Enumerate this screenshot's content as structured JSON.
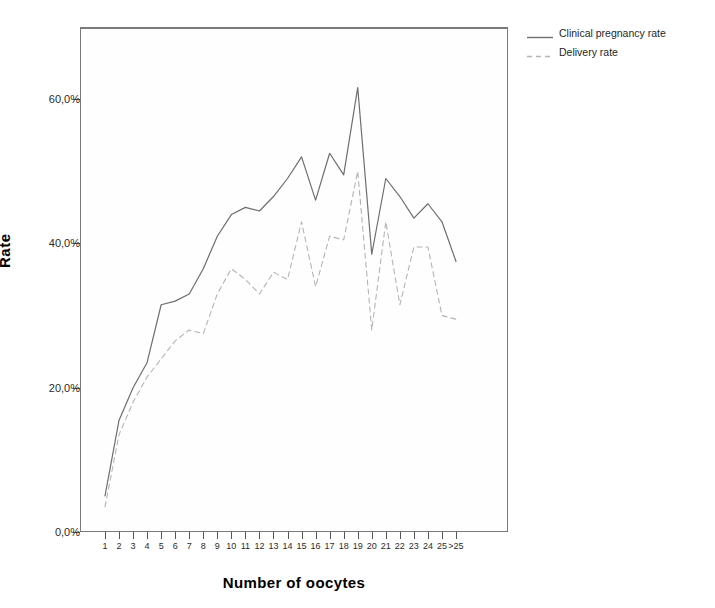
{
  "chart_data": {
    "type": "line",
    "title": "",
    "xlabel": "Number of oocytes",
    "ylabel": "Rate",
    "categories": [
      "1",
      "2",
      "3",
      "4",
      "5",
      "6",
      "7",
      "8",
      "9",
      "10",
      "11",
      "12",
      "13",
      "14",
      "15",
      "16",
      "17",
      "18",
      "19",
      "20",
      "21",
      "22",
      "23",
      "24",
      "25",
      ">25"
    ],
    "ylim": [
      0,
      70
    ],
    "ytick_values": [
      0,
      20,
      40,
      60
    ],
    "ytick_labels": [
      "0,0%",
      "20,0%",
      "40,0%",
      "60,0%"
    ],
    "grid": false,
    "legend_position": "top-right",
    "series": [
      {
        "name": "Clinical pregnancy rate",
        "style": "solid",
        "color": "#6e6e6e",
        "values": [
          5.0,
          15.5,
          20.0,
          23.5,
          31.5,
          32.0,
          33.0,
          36.5,
          41.0,
          44.0,
          45.0,
          44.5,
          46.5,
          49.0,
          52.0,
          46.0,
          52.5,
          49.5,
          61.6,
          38.5,
          49.0,
          46.5,
          43.5,
          45.5,
          43.0,
          37.5
        ]
      },
      {
        "name": "Delivery rate",
        "style": "dashed",
        "color": "#b4b4b4",
        "values": [
          3.5,
          13.5,
          18.0,
          21.5,
          24.0,
          26.5,
          28.0,
          27.5,
          33.0,
          36.5,
          35.0,
          33.0,
          36.0,
          35.0,
          43.0,
          34.0,
          41.0,
          40.5,
          50.0,
          28.0,
          43.0,
          31.5,
          39.5,
          39.5,
          30.0,
          29.5
        ]
      }
    ]
  },
  "legend": {
    "items": [
      {
        "label": "Clinical pregnancy rate",
        "style": "solid"
      },
      {
        "label": "Delivery rate",
        "style": "dashed"
      }
    ]
  },
  "axes": {
    "y_title": "Rate",
    "x_title": "Number of oocytes"
  }
}
